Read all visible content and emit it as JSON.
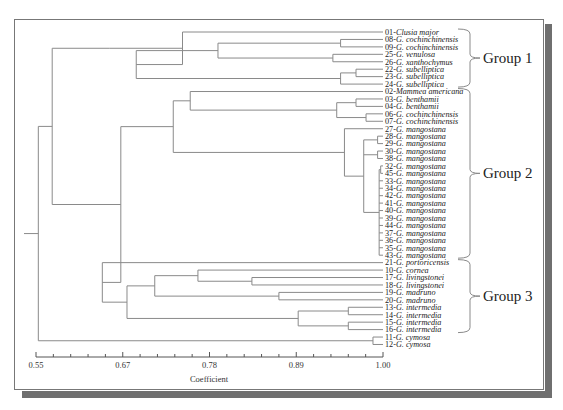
{
  "chart_data": {
    "type": "dendrogram",
    "title": "",
    "xlabel": "Coefficient",
    "ylabel": "",
    "xlim": [
      0.55,
      1.0
    ],
    "x_ticks": [
      "0.55",
      "0.67",
      "0.78",
      "0.89",
      "1.00"
    ],
    "minor_ticks_per_major": 5,
    "leaves": [
      {
        "id": "01",
        "name": "Clusia major"
      },
      {
        "id": "08",
        "name": "G. cochinchinensis"
      },
      {
        "id": "09",
        "name": "G. cochinchinensis"
      },
      {
        "id": "25",
        "name": "G. venulosa"
      },
      {
        "id": "26",
        "name": "G. xanthochymus"
      },
      {
        "id": "22",
        "name": "G. subelliptica"
      },
      {
        "id": "23",
        "name": "G. subelliptica"
      },
      {
        "id": "24",
        "name": "G. subelliptica"
      },
      {
        "id": "02",
        "name": "Mammea americana"
      },
      {
        "id": "03",
        "name": "G. benthamii"
      },
      {
        "id": "04",
        "name": "G. benthamii"
      },
      {
        "id": "06",
        "name": "G. cochinchinensis"
      },
      {
        "id": "07",
        "name": "G. cochinchinensis"
      },
      {
        "id": "27",
        "name": "G. mangostana"
      },
      {
        "id": "28",
        "name": "G. mangostana"
      },
      {
        "id": "29",
        "name": "G. mangostana"
      },
      {
        "id": "30",
        "name": "G. mangostana"
      },
      {
        "id": "38",
        "name": "G. mangostana"
      },
      {
        "id": "32",
        "name": "G. mangostana"
      },
      {
        "id": "45",
        "name": "G. mangostana"
      },
      {
        "id": "33",
        "name": "G. mangostana"
      },
      {
        "id": "34",
        "name": "G. mangostana"
      },
      {
        "id": "42",
        "name": "G. mangostana"
      },
      {
        "id": "41",
        "name": "G. mangostana"
      },
      {
        "id": "40",
        "name": "G. mangostana"
      },
      {
        "id": "39",
        "name": "G. mangostana"
      },
      {
        "id": "44",
        "name": "G. mangostana"
      },
      {
        "id": "37",
        "name": "G. mangostana"
      },
      {
        "id": "36",
        "name": "G. mangostana"
      },
      {
        "id": "35",
        "name": "G. mangostana"
      },
      {
        "id": "43",
        "name": "G. mangostana"
      },
      {
        "id": "21",
        "name": "G. portoricensis"
      },
      {
        "id": "10",
        "name": "G. cornea"
      },
      {
        "id": "17",
        "name": "G. livingstonei"
      },
      {
        "id": "18",
        "name": "G. livingstonei"
      },
      {
        "id": "19",
        "name": "G. madruno"
      },
      {
        "id": "20",
        "name": "G. madruno"
      },
      {
        "id": "13",
        "name": "G. intermedia"
      },
      {
        "id": "14",
        "name": "G. intermedia"
      },
      {
        "id": "15",
        "name": "G. intermedia"
      },
      {
        "id": "16",
        "name": "G. intermedia"
      },
      {
        "id": "11",
        "name": "G. cymosa"
      },
      {
        "id": "12",
        "name": "G. cymosa"
      }
    ],
    "tree": [
      0.553,
      [
        0.571,
        [
          0.645,
          [
            0.74,
            0,
            [
              0.68,
              [
                0.786,
                [
                  0.945,
                  1,
                  2
                ],
                [
                  0.935,
                  3,
                  4
                ]
              ],
              [
                0.945,
                [
                  0.965,
                  5,
                  6
                ],
                7
              ]
            ]
          ]
        ],
        [
          0.66,
          [
            0.728,
            [
              0.75,
              8,
              [
                0.94,
                [
                  0.965,
                  9,
                  10
                ],
                [
                  0.978,
                  11,
                  12
                ]
              ]
            ],
            [
              0.95,
              13,
              [
                0.975,
                [
                  0.993,
                  14,
                  15
                ],
                [
                  0.993,
                  16,
                  17
                ],
                [
                  0.995,
                  [
                    0.997,
                    18,
                    19
                  ],
                  20,
                  21,
                  22,
                  23,
                  24,
                  25,
                  26,
                  27,
                  28,
                  29,
                  30
                ]
              ]
            ]
          ],
          [
            0.636,
            31,
            [
              0.668,
              [
                0.704,
                [
                  0.76,
                  32,
                  [
                    0.83,
                    33,
                    34
                  ]
                ],
                [
                  0.865,
                  35,
                  36
                ]
              ],
              [
                0.89,
                [
                  0.955,
                  37,
                  38
                ],
                [
                  0.955,
                  39,
                  40
                ]
              ]
            ]
          ]
        ]
      ],
      [
        0.987,
        41,
        42
      ]
    ],
    "groups": [
      {
        "label": "Group 1",
        "from": 0,
        "to": 7
      },
      {
        "label": "Group 2",
        "from": 8,
        "to": 30
      },
      {
        "label": "Group 3",
        "from": 31,
        "to": 40
      }
    ]
  }
}
